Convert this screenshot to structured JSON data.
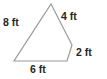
{
  "figure": {
    "type": "geometry-polygon-diagram",
    "shape_name": "quadrilateral",
    "background_color": "#ffffff",
    "stroke_color": "#9a9a9a",
    "label_color": "#262626",
    "unit": "ft",
    "vertices": [
      {
        "name": "apex",
        "x": 51,
        "y": 4
      },
      {
        "name": "right",
        "x": 72,
        "y": 45
      },
      {
        "name": "bottom-right",
        "x": 67,
        "y": 61
      },
      {
        "name": "bottom-left",
        "x": 14,
        "y": 61
      }
    ],
    "sides": [
      {
        "position": "left",
        "label": "8 ft",
        "value": 8
      },
      {
        "position": "upper-right",
        "label": "4 ft",
        "value": 4
      },
      {
        "position": "right",
        "label": "2 ft",
        "value": 2
      },
      {
        "position": "bottom",
        "label": "6 ft",
        "value": 6
      }
    ]
  }
}
